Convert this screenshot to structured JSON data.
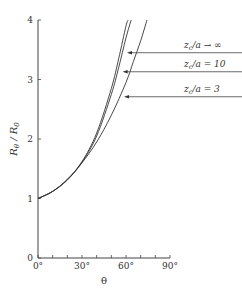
{
  "chart_data": {
    "type": "line",
    "title": "",
    "xlabel": "θ",
    "ylabel": "R_θ / R_0",
    "xlim": [
      0,
      90
    ],
    "ylim": [
      0,
      4
    ],
    "xticks": [
      0,
      10,
      20,
      30,
      40,
      50,
      60,
      70,
      80,
      90
    ],
    "xtick_labels": [
      "0°",
      "30°",
      "60°",
      "90°"
    ],
    "xtick_label_values": [
      0,
      30,
      60,
      90
    ],
    "yticks": [
      0,
      1,
      2,
      3,
      4
    ],
    "ytick_labels": [
      "0",
      "1",
      "2",
      "3",
      "4"
    ],
    "grid": false,
    "series": [
      {
        "name": "z_c/a → ∞",
        "x": [
          0,
          10,
          20,
          30,
          40,
          50,
          55,
          60,
          61.5
        ],
        "y": [
          1,
          1.12,
          1.32,
          1.62,
          2.1,
          2.85,
          3.35,
          3.9,
          4.0
        ],
        "annotation_at": [
          60,
          3.45
        ]
      },
      {
        "name": "z_c/a = 10",
        "x": [
          0,
          10,
          20,
          30,
          40,
          50,
          55,
          60,
          63.5
        ],
        "y": [
          1,
          1.12,
          1.32,
          1.61,
          2.05,
          2.75,
          3.2,
          3.7,
          4.0
        ],
        "annotation_at": [
          57,
          3.13
        ]
      },
      {
        "name": "z_c/a = 3",
        "x": [
          0,
          10,
          20,
          30,
          40,
          50,
          60,
          65,
          70,
          74.3
        ],
        "y": [
          1,
          1.12,
          1.31,
          1.6,
          1.95,
          2.4,
          2.95,
          3.3,
          3.65,
          4.0
        ],
        "annotation_at": [
          58,
          2.71
        ]
      }
    ],
    "legend_labels": [
      {
        "prefix": "z",
        "sub": "c",
        "suffix": "/a → ∞"
      },
      {
        "prefix": "z",
        "sub": "c",
        "suffix": "/a = 10"
      },
      {
        "prefix": "z",
        "sub": "c",
        "suffix": "/a = 3"
      }
    ],
    "legend_placement": "right, with arrows pointing to curves"
  }
}
